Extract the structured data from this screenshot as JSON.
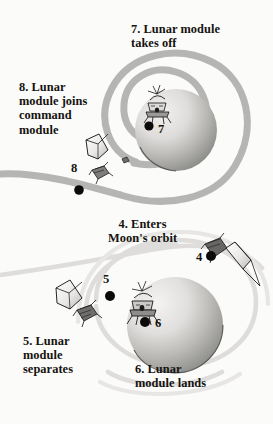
{
  "figure": {
    "kind": "apollo-lunar-mission-diagram",
    "background_color": "#fbfbfa",
    "ink_color": "#15130f",
    "trajectory_color_dark": "#b0b0b0",
    "trajectory_color_light": "#dcdcdc",
    "moon_light": "#efeeec",
    "moon_dark": "#8d8d8d"
  },
  "captions": {
    "step7": "7. Lunar module\ntakes off",
    "step8": "8. Lunar\nmodule joins\ncommand\nmodule",
    "step4": "4. Enters\nMoon's orbit",
    "step5": "5. Lunar\nmodule\nseparates",
    "step6": "6. Lunar\nmodule lands"
  },
  "markers": {
    "m4": "4",
    "m5": "5",
    "m6": "6",
    "m7": "7",
    "m8": "8"
  },
  "scenes": [
    {
      "name": "upper-scene",
      "moon": {
        "center_x": 176,
        "center_y": 130,
        "radius": 41
      },
      "orbit_type": "spiral",
      "craft": [
        "lunar-module-ascending",
        "command-module",
        "lunar-module-descent-stage"
      ]
    },
    {
      "name": "lower-scene",
      "moon": {
        "center_x": 175,
        "center_y": 325,
        "radius": 48
      },
      "orbit_type": "arcs",
      "craft": [
        "command-service-module",
        "command-module",
        "lunar-module-separated",
        "lunar-module-landed"
      ]
    }
  ]
}
